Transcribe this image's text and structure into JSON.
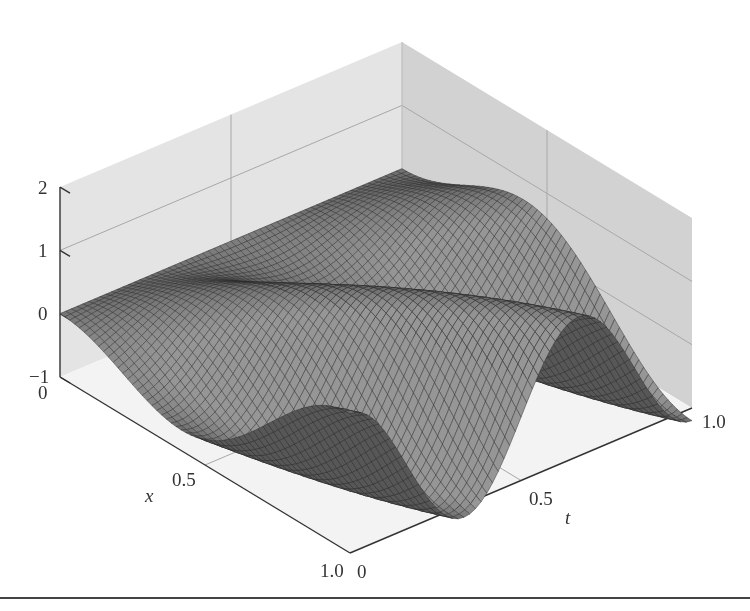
{
  "chart_data": {
    "type": "surface",
    "title": "",
    "xlabel": "x",
    "ylabel": "t",
    "zlabel": "",
    "x_ticks": [
      "0",
      "0.5",
      "1.0"
    ],
    "t_ticks": [
      "0",
      "0.5",
      "1.0"
    ],
    "z_ticks": [
      "2",
      "1",
      "0",
      "−1"
    ],
    "xlim": [
      0,
      1
    ],
    "tlim": [
      0,
      1
    ],
    "zlim": [
      -1,
      2
    ],
    "grid": true,
    "legend": null,
    "surface_description": "Mesh surface u(x,t), zero at x=0 and at t=0, three wave crests travelling diagonally across the (x,t) domain; amplitude roughly 1.2 at x=1",
    "surface_model": {
      "formula": "A*sin(pi*x/2)*sin(k*pi*t - p*pi*x)",
      "A": 1.2,
      "k": 3,
      "p": 1.5,
      "mesh_resolution": 60
    }
  },
  "colors": {
    "wall": "#e4e4e4",
    "wall_right": "#d2d2d2",
    "floor": "#f3f3f3",
    "grid": "#a8a8a8",
    "mesh_fill": "#7a7a7a",
    "mesh_line": "#2a2a2a",
    "axis": "#333333"
  },
  "labels": {
    "z_tick_2": "2",
    "z_tick_1": "1",
    "z_tick_0": "0",
    "z_tick_m1": "−1",
    "x_tick_0": "0",
    "x_tick_05": "0.5",
    "x_tick_10": "1.0",
    "t_tick_0": "0",
    "t_tick_05": "0.5",
    "t_tick_10": "1.0",
    "x_name": "x",
    "t_name": "t"
  }
}
